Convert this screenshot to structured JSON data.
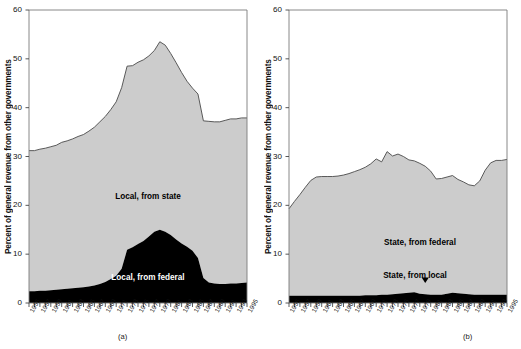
{
  "figure": {
    "panels": [
      {
        "id": "a",
        "caption": "(a)",
        "ylabel": "Percent of general revenue from other governments",
        "series_labels": [
          {
            "text": "Local, from state",
            "x": 148,
            "y": 192
          },
          {
            "text": "Local, from federal",
            "x": 148,
            "y": 273
          }
        ]
      },
      {
        "id": "b",
        "caption": "(b)",
        "ylabel": "Percent of general revenue from other governments",
        "series_labels": [
          {
            "text": "State, from federal",
            "x": 420,
            "y": 238
          },
          {
            "text": "State, from local",
            "x": 415,
            "y": 271
          }
        ]
      }
    ]
  },
  "chart_data": [
    {
      "type": "area",
      "stacked": true,
      "title": "",
      "panel": "(a)",
      "xlabel": "",
      "ylabel": "Percent of general revenue from other governments",
      "ylim": [
        0,
        60
      ],
      "yticks": [
        0,
        10,
        20,
        30,
        40,
        50,
        60
      ],
      "xlim": [
        1955,
        1995
      ],
      "xticks": [
        1955,
        1957,
        1959,
        1961,
        1963,
        1965,
        1967,
        1969,
        1971,
        1973,
        1975,
        1977,
        1979,
        1981,
        1983,
        1985,
        1987,
        1989,
        1991,
        1993,
        1995
      ],
      "grid": false,
      "legend_position": "inline-annotation",
      "x": [
        1955,
        1956,
        1957,
        1958,
        1959,
        1960,
        1961,
        1962,
        1963,
        1964,
        1965,
        1966,
        1967,
        1968,
        1969,
        1970,
        1971,
        1972,
        1973,
        1974,
        1975,
        1976,
        1977,
        1978,
        1979,
        1980,
        1981,
        1982,
        1983,
        1984,
        1985,
        1986,
        1987,
        1988,
        1989,
        1990,
        1991,
        1992,
        1993,
        1994,
        1995
      ],
      "series": [
        {
          "name": "Local, from federal",
          "color": "#000000",
          "values": [
            2.4,
            2.4,
            2.5,
            2.5,
            2.6,
            2.7,
            2.8,
            2.9,
            3.0,
            3.1,
            3.2,
            3.4,
            3.6,
            3.9,
            4.3,
            4.9,
            5.6,
            7.0,
            10.9,
            11.4,
            12.1,
            12.7,
            13.6,
            14.6,
            15.0,
            14.6,
            13.9,
            13.0,
            12.2,
            11.5,
            10.7,
            9.2,
            5.1,
            4.2,
            4.0,
            3.9,
            3.9,
            4.0,
            4.0,
            4.1,
            4.2
          ]
        },
        {
          "name": "Local, from state",
          "color": "#cccccc",
          "values": [
            28.8,
            28.8,
            29.0,
            29.2,
            29.4,
            29.6,
            30.1,
            30.3,
            30.6,
            31.0,
            31.3,
            31.8,
            32.4,
            33.2,
            33.9,
            34.7,
            35.6,
            37.1,
            37.6,
            37.2,
            37.2,
            37.1,
            37.0,
            37.1,
            38.5,
            38.2,
            37.2,
            36.2,
            35.0,
            33.9,
            33.3,
            33.6,
            32.2,
            33.0,
            33.1,
            33.2,
            33.5,
            33.7,
            33.7,
            33.8,
            33.7
          ]
        }
      ],
      "total_top": [
        31.2,
        31.2,
        31.5,
        31.7,
        32.0,
        32.3,
        32.9,
        33.2,
        33.6,
        34.1,
        34.5,
        35.2,
        36.0,
        37.1,
        38.2,
        39.6,
        41.2,
        44.1,
        48.5,
        48.6,
        49.3,
        49.8,
        50.6,
        51.7,
        53.5,
        52.8,
        51.1,
        49.2,
        47.2,
        45.4,
        44.0,
        42.8,
        37.3,
        37.2,
        37.1,
        37.1,
        37.4,
        37.7,
        37.7,
        37.9,
        37.9
      ]
    },
    {
      "type": "area",
      "stacked": true,
      "title": "",
      "panel": "(b)",
      "xlabel": "",
      "ylabel": "Percent of general revenue from other governments",
      "ylim": [
        0,
        60
      ],
      "yticks": [
        0,
        10,
        20,
        30,
        40,
        50,
        60
      ],
      "xlim": [
        1955,
        1995
      ],
      "xticks": [
        1955,
        1957,
        1959,
        1961,
        1963,
        1965,
        1967,
        1969,
        1971,
        1973,
        1975,
        1977,
        1979,
        1981,
        1983,
        1985,
        1987,
        1989,
        1991,
        1993,
        1995
      ],
      "grid": false,
      "legend_position": "inline-annotation",
      "x": [
        1955,
        1956,
        1957,
        1958,
        1959,
        1960,
        1961,
        1962,
        1963,
        1964,
        1965,
        1966,
        1967,
        1968,
        1969,
        1970,
        1971,
        1972,
        1973,
        1974,
        1975,
        1976,
        1977,
        1978,
        1979,
        1980,
        1981,
        1982,
        1983,
        1984,
        1985,
        1986,
        1987,
        1988,
        1989,
        1990,
        1991,
        1992,
        1993,
        1994,
        1995
      ],
      "series": [
        {
          "name": "State, from local",
          "color": "#000000",
          "values": [
            1.5,
            1.5,
            1.5,
            1.5,
            1.5,
            1.5,
            1.5,
            1.5,
            1.5,
            1.5,
            1.5,
            1.5,
            1.5,
            1.5,
            1.6,
            1.6,
            1.6,
            1.7,
            1.7,
            1.8,
            1.9,
            2.0,
            2.1,
            2.2,
            1.9,
            1.8,
            1.7,
            1.7,
            1.7,
            1.9,
            2.1,
            2.0,
            1.9,
            1.8,
            1.7,
            1.7,
            1.7,
            1.7,
            1.7,
            1.7,
            1.7
          ]
        },
        {
          "name": "State, from federal",
          "color": "#cccccc",
          "values": [
            17.8,
            19.3,
            20.7,
            22.2,
            23.6,
            24.3,
            24.4,
            24.4,
            24.4,
            24.5,
            24.7,
            25.0,
            25.4,
            25.8,
            26.2,
            26.9,
            27.9,
            27.2,
            29.3,
            28.3,
            28.6,
            28.0,
            27.2,
            26.9,
            26.7,
            26.2,
            25.3,
            23.7,
            23.8,
            23.9,
            24.0,
            23.3,
            22.9,
            22.4,
            22.3,
            23.3,
            25.5,
            27.0,
            27.5,
            27.5,
            27.7
          ]
        }
      ],
      "total_top": [
        19.3,
        20.8,
        22.2,
        23.7,
        25.1,
        25.8,
        25.9,
        25.9,
        25.9,
        26.0,
        26.2,
        26.5,
        26.9,
        27.3,
        27.8,
        28.5,
        29.5,
        28.9,
        31.0,
        30.1,
        30.5,
        30.0,
        29.3,
        29.1,
        28.6,
        28.0,
        27.0,
        25.4,
        25.5,
        25.8,
        26.1,
        25.3,
        24.8,
        24.2,
        24.0,
        25.0,
        27.2,
        28.7,
        29.2,
        29.2,
        29.4
      ]
    }
  ],
  "colors": {
    "upper_band": "#cccccc",
    "lower_band": "#000000",
    "axis": "#555555",
    "text": "#111111"
  },
  "annotations": {
    "arrow_marker": "down-arrow-marker"
  }
}
